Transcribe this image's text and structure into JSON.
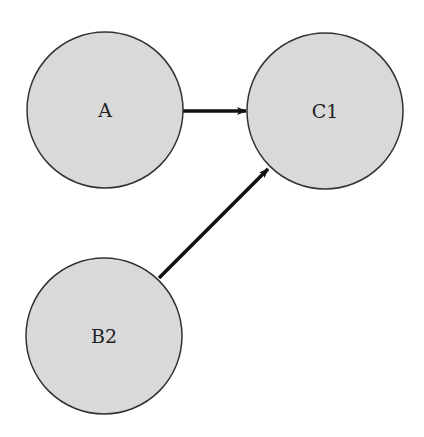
{
  "diagram": {
    "type": "directed-graph",
    "colors": {
      "node_fill": "#d9d9d9",
      "node_stroke": "#333333",
      "edge": "#111111",
      "background": "#ffffff"
    },
    "nodes": [
      {
        "id": "A",
        "label": "A",
        "cx": 105,
        "cy": 110,
        "r": 78
      },
      {
        "id": "C1",
        "label": "C1",
        "cx": 325,
        "cy": 111,
        "r": 78
      },
      {
        "id": "B2",
        "label": "B2",
        "cx": 104,
        "cy": 336,
        "r": 78
      }
    ],
    "edges": [
      {
        "from": "A",
        "to": "C1",
        "x1": 183,
        "y1": 111,
        "x2": 246,
        "y2": 111
      },
      {
        "from": "B2",
        "to": "C1",
        "x1": 159,
        "y1": 278,
        "x2": 268,
        "y2": 169
      }
    ]
  }
}
